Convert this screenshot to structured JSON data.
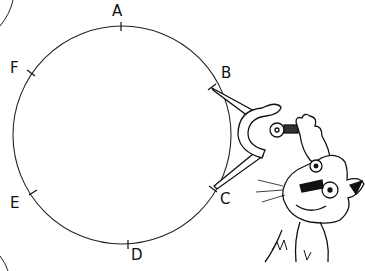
{
  "illustration": {
    "subject": "circle divided into six points with a compass held by a cartoon cat",
    "circle": {
      "cx": 122,
      "cy": 135,
      "r": 109
    },
    "points": [
      {
        "label": "A",
        "x": 112,
        "y": 4
      },
      {
        "label": "B",
        "x": 221,
        "y": 66
      },
      {
        "label": "C",
        "x": 220,
        "y": 192
      },
      {
        "label": "D",
        "x": 131,
        "y": 248
      },
      {
        "label": "E",
        "x": 10,
        "y": 196
      },
      {
        "label": "F",
        "x": 10,
        "y": 61
      }
    ],
    "colors": {
      "ink": "#111111",
      "background": "#ffffff"
    }
  }
}
